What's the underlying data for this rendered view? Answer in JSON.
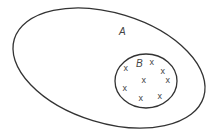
{
  "diagram": {
    "type": "venn-subset",
    "outer_set": {
      "label": "A",
      "stroke": "#333333"
    },
    "inner_set": {
      "label": "B",
      "stroke": "#333333"
    },
    "elements": [
      {
        "symbol": "x",
        "x": 126,
        "y": 71
      },
      {
        "symbol": "x",
        "x": 152,
        "y": 65
      },
      {
        "symbol": "x",
        "x": 163,
        "y": 74
      },
      {
        "symbol": "x",
        "x": 168,
        "y": 83
      },
      {
        "symbol": "x",
        "x": 144,
        "y": 83
      },
      {
        "symbol": "x",
        "x": 125,
        "y": 91
      },
      {
        "symbol": "x",
        "x": 141,
        "y": 101
      },
      {
        "symbol": "x",
        "x": 160,
        "y": 99
      }
    ]
  }
}
